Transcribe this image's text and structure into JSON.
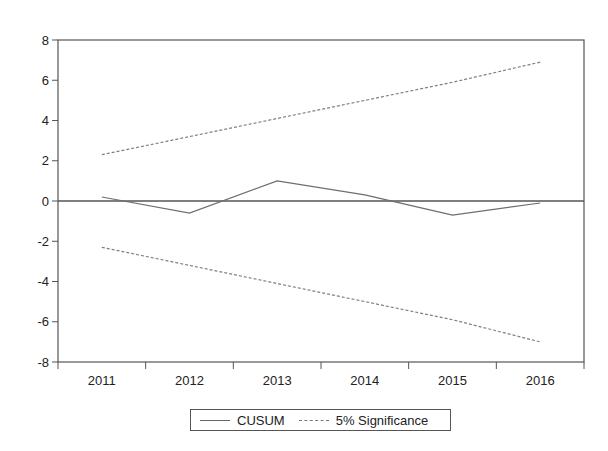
{
  "chart_data": {
    "type": "line",
    "title": "",
    "xlabel": "",
    "ylabel": "",
    "categories": [
      "2011",
      "2012",
      "2013",
      "2014",
      "2015",
      "2016"
    ],
    "series": [
      {
        "name": "CUSUM",
        "style": "solid",
        "color": "#6e6e6e",
        "values": [
          0.2,
          -0.6,
          1.0,
          0.3,
          -0.7,
          -0.1
        ]
      },
      {
        "name": "5% Significance (upper)",
        "style": "dashed",
        "color": "#808080",
        "values": [
          2.3,
          3.2,
          4.1,
          5.0,
          5.9,
          6.9
        ]
      },
      {
        "name": "5% Significance (lower)",
        "style": "dashed",
        "color": "#808080",
        "values": [
          -2.3,
          -3.2,
          -4.1,
          -5.0,
          -5.9,
          -7.0
        ]
      }
    ],
    "ylim": [
      -8,
      8
    ],
    "yticks": [
      -8,
      -6,
      -4,
      -2,
      0,
      2,
      4,
      6,
      8
    ],
    "zero_line": true,
    "grid": false,
    "legend_position": "bottom-center"
  },
  "legend": {
    "items": [
      {
        "label": "CUSUM",
        "style": "solid"
      },
      {
        "label": "5% Significance",
        "style": "dashed"
      }
    ]
  }
}
